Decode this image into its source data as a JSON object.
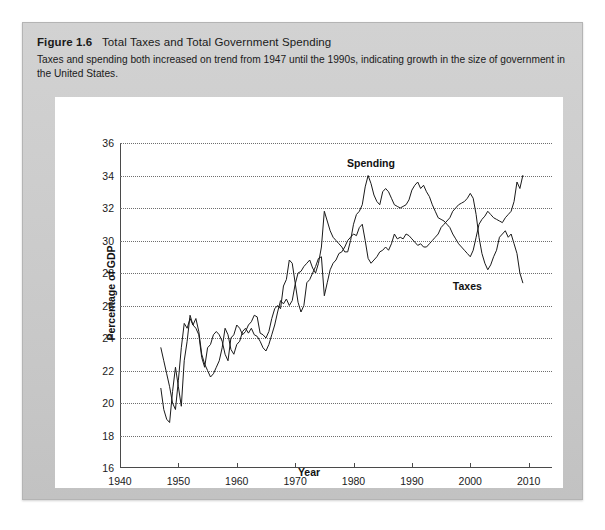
{
  "figure": {
    "label": "Figure 1.6",
    "title": "Total Taxes and Total Government Spending",
    "subtitle": "Taxes and spending both increased on trend from 1947 until the 1990s, indicating growth in the size of government in the United States."
  },
  "colors": {
    "panel_background": "#cfcfcf",
    "card_background": "#ffffff",
    "line": "#1a1a1a",
    "gridline": "#6e6e6e",
    "axis": "#4a4a4a",
    "text": "#1a1a1a"
  },
  "chart_data": {
    "type": "line",
    "title": "Total Taxes and Total Government Spending",
    "xlabel": "Year",
    "ylabel": "Percentage of GDP",
    "xlim": [
      1940,
      2014
    ],
    "ylim": [
      16,
      36
    ],
    "xticks": [
      1940,
      1950,
      1960,
      1970,
      1980,
      1990,
      2000,
      2010
    ],
    "yticks": [
      16,
      18,
      20,
      22,
      24,
      26,
      28,
      30,
      32,
      34,
      36
    ],
    "grid": true,
    "grid_style": "dotted-horizontal",
    "legend": "inline-annotations",
    "annotations": [
      {
        "text": "Spending",
        "x": 1983.0,
        "y": 34.8
      },
      {
        "text": "Taxes",
        "x": 1999.5,
        "y": 27.2
      }
    ],
    "series": [
      {
        "name": "Spending",
        "label_text": "Spending",
        "x": [
          1947.0,
          1947.5,
          1948.0,
          1948.5,
          1949.0,
          1949.5,
          1950.0,
          1950.5,
          1951.0,
          1951.5,
          1952.0,
          1952.5,
          1953.0,
          1953.5,
          1954.0,
          1954.5,
          1955.0,
          1955.5,
          1956.0,
          1956.5,
          1957.0,
          1957.5,
          1958.0,
          1958.5,
          1959.0,
          1959.5,
          1960.0,
          1960.5,
          1961.0,
          1961.5,
          1962.0,
          1962.5,
          1963.0,
          1963.5,
          1964.0,
          1964.5,
          1965.0,
          1965.5,
          1966.0,
          1966.5,
          1967.0,
          1967.5,
          1968.0,
          1968.5,
          1969.0,
          1969.5,
          1970.0,
          1970.5,
          1971.0,
          1971.5,
          1972.0,
          1972.5,
          1973.0,
          1973.5,
          1974.0,
          1974.5,
          1975.0,
          1975.5,
          1976.0,
          1976.5,
          1977.0,
          1977.5,
          1978.0,
          1978.5,
          1979.0,
          1979.5,
          1980.0,
          1980.5,
          1981.0,
          1981.5,
          1982.0,
          1982.5,
          1983.0,
          1983.5,
          1984.0,
          1984.5,
          1985.0,
          1985.5,
          1986.0,
          1986.5,
          1987.0,
          1987.5,
          1988.0,
          1988.5,
          1989.0,
          1989.5,
          1990.0,
          1990.5,
          1991.0,
          1991.5,
          1992.0,
          1992.5,
          1993.0,
          1993.5,
          1994.0,
          1994.5,
          1995.0,
          1995.5,
          1996.0,
          1996.5,
          1997.0,
          1997.5,
          1998.0,
          1998.5,
          1999.0,
          1999.5,
          2000.0,
          2000.5,
          2001.0,
          2001.5,
          2002.0,
          2002.5,
          2003.0,
          2003.5,
          2004.0,
          2004.5,
          2005.0,
          2005.5,
          2006.0,
          2006.5,
          2007.0,
          2007.5,
          2008.0,
          2008.5,
          2009.0
        ],
        "y": [
          20.9,
          19.6,
          19.0,
          18.8,
          20.7,
          22.2,
          21.0,
          19.8,
          22.6,
          23.8,
          25.4,
          24.8,
          25.2,
          24.4,
          23.0,
          22.4,
          22.0,
          21.6,
          21.8,
          22.2,
          22.6,
          23.4,
          24.6,
          24.2,
          23.3,
          23.0,
          23.6,
          23.8,
          24.4,
          24.6,
          24.3,
          24.6,
          24.2,
          24.1,
          23.8,
          23.4,
          23.2,
          23.6,
          24.2,
          24.8,
          25.6,
          26.3,
          26.1,
          26.4,
          26.0,
          26.3,
          27.3,
          28.0,
          28.1,
          28.4,
          28.6,
          28.8,
          28.3,
          28.0,
          28.6,
          29.6,
          31.8,
          31.2,
          30.6,
          30.2,
          30.0,
          29.8,
          29.6,
          29.3,
          29.3,
          30.0,
          31.0,
          31.6,
          31.8,
          32.2,
          33.3,
          34.0,
          33.5,
          32.8,
          32.4,
          32.2,
          33.0,
          33.2,
          33.0,
          32.6,
          32.2,
          32.1,
          32.0,
          32.1,
          32.2,
          32.5,
          33.1,
          33.4,
          33.6,
          33.2,
          33.4,
          33.0,
          32.7,
          32.2,
          31.8,
          31.4,
          31.3,
          31.2,
          31.0,
          30.8,
          30.4,
          30.1,
          29.8,
          29.6,
          29.4,
          29.2,
          29.0,
          29.4,
          30.2,
          31.0,
          31.3,
          31.5,
          31.8,
          31.6,
          31.4,
          31.3,
          31.2,
          31.1,
          31.4,
          31.6,
          31.8,
          32.4,
          33.6,
          33.2,
          34.0
        ],
        "n_points": 125,
        "units": "percent of GDP",
        "range_observed": [
          18.8,
          34.0
        ],
        "start_value": 20.9,
        "end_value": 34.0
      },
      {
        "name": "Taxes",
        "label_text": "Taxes",
        "x": [
          1947.0,
          1947.5,
          1948.0,
          1948.5,
          1949.0,
          1949.5,
          1950.0,
          1950.5,
          1951.0,
          1951.5,
          1952.0,
          1952.5,
          1953.0,
          1953.5,
          1954.0,
          1954.5,
          1955.0,
          1955.5,
          1956.0,
          1956.5,
          1957.0,
          1957.5,
          1958.0,
          1958.5,
          1959.0,
          1959.5,
          1960.0,
          1960.5,
          1961.0,
          1961.5,
          1962.0,
          1962.5,
          1963.0,
          1963.5,
          1964.0,
          1964.5,
          1965.0,
          1965.5,
          1966.0,
          1966.5,
          1967.0,
          1967.5,
          1968.0,
          1968.5,
          1969.0,
          1969.5,
          1970.0,
          1970.5,
          1971.0,
          1971.5,
          1972.0,
          1972.5,
          1973.0,
          1973.5,
          1974.0,
          1974.5,
          1975.0,
          1975.5,
          1976.0,
          1976.5,
          1977.0,
          1977.5,
          1978.0,
          1978.5,
          1979.0,
          1979.5,
          1980.0,
          1980.5,
          1981.0,
          1981.5,
          1982.0,
          1982.5,
          1983.0,
          1983.5,
          1984.0,
          1984.5,
          1985.0,
          1985.5,
          1986.0,
          1986.5,
          1987.0,
          1987.5,
          1988.0,
          1988.5,
          1989.0,
          1989.5,
          1990.0,
          1990.5,
          1991.0,
          1991.5,
          1992.0,
          1992.5,
          1993.0,
          1993.5,
          1994.0,
          1994.5,
          1995.0,
          1995.5,
          1996.0,
          1996.5,
          1997.0,
          1997.5,
          1998.0,
          1998.5,
          1999.0,
          1999.5,
          2000.0,
          2000.5,
          2001.0,
          2001.5,
          2002.0,
          2002.5,
          2003.0,
          2003.5,
          2004.0,
          2004.5,
          2005.0,
          2005.5,
          2006.0,
          2006.5,
          2007.0,
          2007.5,
          2008.0,
          2008.5,
          2009.0
        ],
        "y": [
          23.4,
          22.6,
          21.8,
          21.0,
          20.0,
          19.6,
          21.4,
          23.4,
          24.9,
          24.6,
          25.2,
          24.8,
          24.6,
          24.2,
          22.8,
          22.2,
          23.4,
          23.6,
          24.2,
          24.4,
          24.2,
          23.8,
          23.0,
          22.6,
          24.0,
          24.2,
          24.8,
          24.6,
          24.2,
          24.4,
          24.8,
          25.0,
          25.4,
          25.3,
          24.3,
          24.2,
          24.0,
          24.4,
          25.2,
          25.8,
          26.0,
          25.8,
          27.2,
          27.6,
          28.8,
          28.6,
          27.4,
          26.2,
          25.6,
          26.0,
          27.4,
          27.6,
          28.0,
          28.4,
          28.9,
          29.0,
          26.6,
          27.4,
          28.2,
          28.6,
          28.8,
          29.2,
          29.3,
          29.6,
          30.0,
          30.2,
          30.4,
          30.3,
          30.8,
          31.0,
          30.0,
          28.9,
          28.6,
          28.8,
          29.0,
          29.3,
          29.4,
          29.6,
          29.4,
          29.8,
          30.4,
          30.1,
          30.2,
          30.1,
          30.4,
          30.3,
          30.1,
          29.9,
          29.7,
          29.8,
          29.6,
          29.6,
          29.8,
          30.0,
          30.2,
          30.4,
          30.8,
          31.0,
          31.2,
          31.4,
          31.8,
          32.0,
          32.2,
          32.3,
          32.4,
          32.6,
          32.9,
          32.6,
          31.6,
          30.2,
          29.2,
          28.6,
          28.2,
          28.5,
          29.0,
          29.4,
          30.2,
          30.4,
          30.6,
          30.2,
          30.4,
          29.8,
          29.2,
          28.0,
          27.4
        ],
        "n_points": 125,
        "units": "percent of GDP",
        "range_observed": [
          19.6,
          32.9
        ],
        "start_value": 23.4,
        "end_value": 27.4
      }
    ]
  }
}
